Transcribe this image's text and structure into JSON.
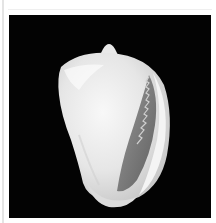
{
  "image": {
    "subject": "white seashell on black background",
    "alt": "Seashell specimen",
    "colors": {
      "background": "#030303",
      "shell": "#eeeeee",
      "shadow": "#7a7a7a",
      "frame": "#ffffff"
    }
  }
}
